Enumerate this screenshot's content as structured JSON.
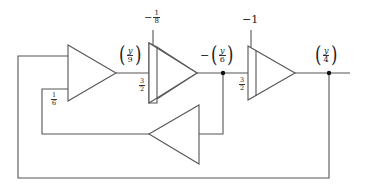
{
  "diagram": {
    "type": "analog-computer-block-diagram",
    "elements": {
      "amp1": {
        "kind": "summer",
        "label": ""
      },
      "amp2": {
        "kind": "integrator",
        "input_gain": "3/2",
        "initial_condition": "-1/8"
      },
      "amp3": {
        "kind": "integrator",
        "input_gain": "3/2",
        "initial_condition": "-1"
      },
      "feedback_amp": {
        "kind": "inverter",
        "label": ""
      }
    },
    "labels": {
      "amp1_output": {
        "prefix": "",
        "var": "y",
        "den": "9"
      },
      "amp2_output": {
        "prefix": "−",
        "var": "y",
        "den": "6"
      },
      "amp3_output": {
        "prefix": "",
        "var": "y",
        "den": "4"
      },
      "amp1_feedback_gain": {
        "num": "1",
        "den": "6"
      },
      "amp2_input_gain": {
        "num": "3",
        "den": "2"
      },
      "amp3_input_gain": {
        "num": "3",
        "den": "2"
      },
      "amp2_ic": {
        "prefix": "−",
        "num": "1",
        "den": "8"
      },
      "amp3_ic": {
        "text": "−1"
      }
    },
    "colors": {
      "line": "#555555",
      "node": "#111111",
      "background": "#ffffff"
    }
  }
}
